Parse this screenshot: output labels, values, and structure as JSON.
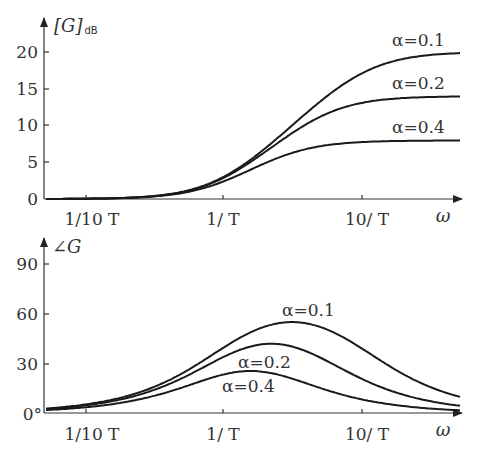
{
  "chart_data": [
    {
      "type": "line",
      "title": "",
      "ylabel": "[G]dB",
      "ylabel_main": "[G]",
      "ylabel_sub": "dB",
      "xlabel": "ω",
      "xscale": "log",
      "x_ticks": [
        "1/10 T",
        "1/ T",
        "10/ T"
      ],
      "y_ticks": [
        "0",
        "5",
        "10",
        "15",
        "20"
      ],
      "ylim": [
        0,
        20
      ],
      "series": [
        {
          "name": "α=0.1",
          "alpha": 0.1,
          "final_value": 20
        },
        {
          "name": "α=0.2",
          "alpha": 0.2,
          "final_value": 14
        },
        {
          "name": "α=0.4",
          "alpha": 0.4,
          "final_value": 8
        }
      ],
      "sample_points": {
        "omegaT": [
          0.05,
          0.1,
          0.3,
          1,
          3,
          10,
          30
        ],
        "α=0.1": [
          0.0,
          0.04,
          0.37,
          2.97,
          9.3,
          16.9,
          19.3
        ],
        "α=0.2": [
          0.0,
          0.04,
          0.36,
          2.84,
          8.4,
          13.0,
          13.8
        ],
        "α=0.4": [
          0.0,
          0.04,
          0.34,
          2.36,
          5.8,
          7.6,
          7.9
        ]
      }
    },
    {
      "type": "line",
      "title": "",
      "ylabel": "∠G",
      "xlabel": "ω",
      "xscale": "log",
      "x_ticks": [
        "1/10 T",
        "1/ T",
        "10/ T"
      ],
      "y_ticks": [
        "0°",
        "30",
        "60",
        "90"
      ],
      "ylim": [
        0,
        90
      ],
      "series": [
        {
          "name": "α=0.1",
          "alpha": 0.1,
          "peak_deg": 55
        },
        {
          "name": "α=0.2",
          "alpha": 0.2,
          "peak_deg": 42
        },
        {
          "name": "α=0.4",
          "alpha": 0.4,
          "peak_deg": 25
        }
      ],
      "sample_points": {
        "omegaT": [
          0.05,
          0.1,
          0.3,
          1,
          3,
          10,
          30
        ],
        "α=0.1": [
          2.6,
          5.1,
          15.0,
          39.3,
          54.9,
          39.3,
          15.0
        ],
        "α=0.2": [
          2.3,
          4.6,
          13.3,
          33.7,
          41.8,
          18.4,
          6.0
        ],
        "α=0.4": [
          1.7,
          3.4,
          9.9,
          23.2,
          24.4,
          8.6,
          3.1
        ]
      }
    }
  ],
  "labels": {
    "top": {
      "ylabel_main": "[G]",
      "ylabel_sub": "dB",
      "y_ticks": [
        "20",
        "15",
        "10",
        "5",
        "0"
      ],
      "x_ticks": [
        "1/10 T",
        "1/ T",
        "10/ T"
      ],
      "xlabel": "ω",
      "curve_labels": [
        "α=0.1",
        "α=0.2",
        "α=0.4"
      ]
    },
    "bottom": {
      "ylabel": "∠G",
      "y_ticks": [
        "90",
        "60",
        "30",
        "0°"
      ],
      "x_ticks": [
        "1/10 T",
        "1/ T",
        "10/ T"
      ],
      "xlabel": "ω",
      "curve_labels": [
        "α=0.1",
        "α=0.2",
        "α=0.4"
      ]
    }
  }
}
